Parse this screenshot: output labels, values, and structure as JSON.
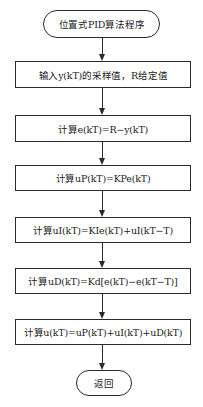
{
  "diagram": {
    "type": "flowchart",
    "direction": "top-to-bottom",
    "colors": {
      "stroke": "#2a2a2a",
      "background": "#ffffff",
      "text": "#222222"
    },
    "nodes": [
      {
        "id": "start",
        "shape": "terminator",
        "label": "位置式PID算法程序"
      },
      {
        "id": "input",
        "shape": "process",
        "label": "输入y(kT)的采样值，R给定值"
      },
      {
        "id": "error",
        "shape": "process",
        "label": "计算e(kT)=R−y(kT)"
      },
      {
        "id": "p_term",
        "shape": "process",
        "label": "计算uP(kT)=KPe(kT)"
      },
      {
        "id": "i_term",
        "shape": "process",
        "label": "计算uI(kT)=KIe(kT)+uI(kT−T)"
      },
      {
        "id": "d_term",
        "shape": "process",
        "label": "计算uD(kT)=Kd[e(kT)−e(kT−T)]"
      },
      {
        "id": "sum",
        "shape": "process",
        "label": "计算u(kT)=uP(kT)+uI(kT)+uD(kT)"
      },
      {
        "id": "end",
        "shape": "terminator",
        "label": "返回"
      }
    ],
    "edges": [
      {
        "from": "start",
        "to": "input"
      },
      {
        "from": "input",
        "to": "error"
      },
      {
        "from": "error",
        "to": "p_term"
      },
      {
        "from": "p_term",
        "to": "i_term"
      },
      {
        "from": "i_term",
        "to": "d_term"
      },
      {
        "from": "d_term",
        "to": "sum"
      },
      {
        "from": "sum",
        "to": "end"
      }
    ]
  }
}
